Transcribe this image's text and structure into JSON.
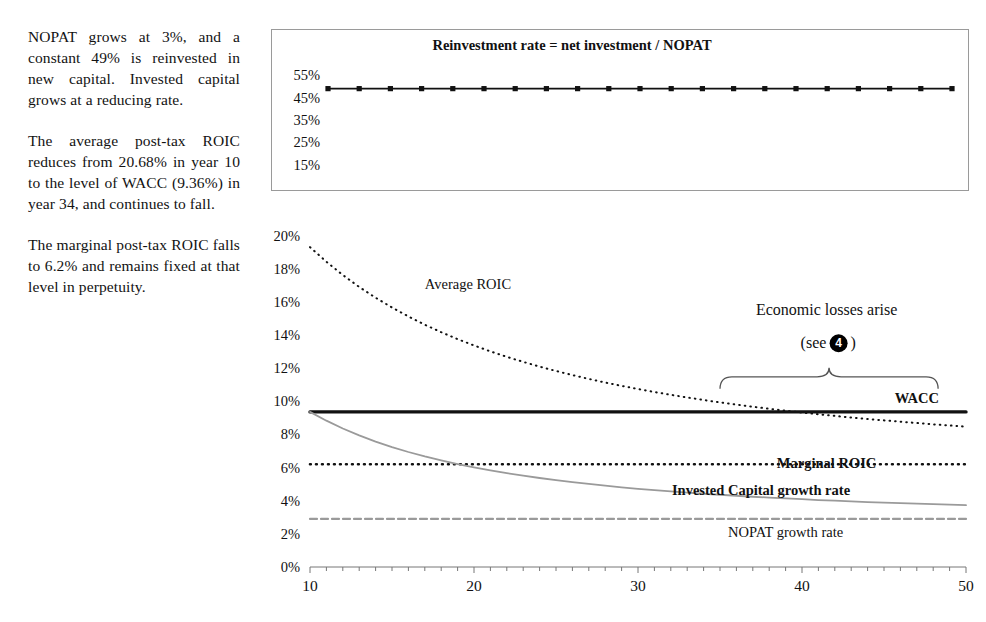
{
  "commentary": {
    "paragraphs": [
      "NOPAT grows at 3%, and a constant 49% is reinvested in new capital. Invested capital grows at a reducing rate.",
      "The average post-tax ROIC reduces from 20.68% in year 10 to the level of WACC (9.36%) in year 34, and continues to fall.",
      "The marginal post-tax ROIC falls to 6.2% and remains fixed at that level in perpetuity."
    ]
  },
  "colors": {
    "ink": "#111111",
    "grey_series": "#9a9a9a",
    "box_border": "#9a9a9a",
    "axis": "#777777"
  },
  "chart_data": [
    {
      "id": "reinvestment-chart",
      "type": "line",
      "title": "Reinvestment rate = net investment / NOPAT",
      "xlabel": "",
      "ylabel": "",
      "xlim": [
        10,
        50
      ],
      "ylim": [
        0.1,
        0.6
      ],
      "ytick_values": [
        0.55,
        0.45,
        0.35,
        0.25,
        0.15
      ],
      "ytick_labels": [
        "55%",
        "45%",
        "35%",
        "25%",
        "15%"
      ],
      "xtick_values": [],
      "xtick_labels": [],
      "grid": false,
      "legend": "none",
      "series": [
        {
          "name": "Reinvestment rate",
          "style": "solid-marker",
          "marker": "square",
          "color": "#111111",
          "x": [
            10,
            11,
            12,
            13,
            14,
            15,
            16,
            17,
            18,
            19,
            20,
            21,
            22,
            23,
            24,
            25,
            26,
            27,
            28,
            29,
            30,
            31,
            32,
            33,
            34,
            35,
            36,
            37,
            38,
            39,
            40,
            41,
            42,
            43,
            44,
            45,
            46,
            47,
            48,
            49,
            50
          ],
          "values": [
            0.49,
            0.49,
            0.49,
            0.49,
            0.49,
            0.49,
            0.49,
            0.49,
            0.49,
            0.49,
            0.49,
            0.49,
            0.49,
            0.49,
            0.49,
            0.49,
            0.49,
            0.49,
            0.49,
            0.49,
            0.49,
            0.49,
            0.49,
            0.49,
            0.49,
            0.49,
            0.49,
            0.49,
            0.49,
            0.49,
            0.49,
            0.49,
            0.49,
            0.49,
            0.49,
            0.49,
            0.49,
            0.49,
            0.49,
            0.49,
            0.49
          ]
        }
      ]
    },
    {
      "id": "roic-chart",
      "type": "line",
      "title": "",
      "xlabel": "",
      "ylabel": "",
      "xlim": [
        10,
        50
      ],
      "ylim": [
        0.0,
        0.21
      ],
      "ytick_values": [
        0.2,
        0.18,
        0.16,
        0.14,
        0.12,
        0.1,
        0.08,
        0.06,
        0.04,
        0.02,
        0.0
      ],
      "ytick_labels": [
        "20%",
        "18%",
        "16%",
        "14%",
        "12%",
        "10%",
        "8%",
        "6%",
        "4%",
        "2%",
        "0%"
      ],
      "xtick_values": [
        10,
        20,
        30,
        40,
        50
      ],
      "xtick_labels": [
        "10",
        "20",
        "30",
        "40",
        "50"
      ],
      "minor_xtick_step": 1,
      "grid": false,
      "legend": "inline-right",
      "series": [
        {
          "name": "Average ROIC",
          "label": "Average ROIC",
          "style": "dotted",
          "color": "#111111",
          "label_x": 17.0,
          "label_y": 0.168,
          "x": [
            10,
            11,
            12,
            13,
            14,
            15,
            16,
            17,
            18,
            19,
            20,
            21,
            22,
            23,
            24,
            25,
            26,
            27,
            28,
            29,
            30,
            31,
            32,
            33,
            34,
            35,
            36,
            37,
            38,
            39,
            40,
            41,
            42,
            43,
            44,
            45,
            46,
            47,
            48,
            49,
            50
          ],
          "values": [
            0.193,
            0.1842,
            0.1762,
            0.169,
            0.1625,
            0.1566,
            0.1512,
            0.1462,
            0.1417,
            0.1375,
            0.1337,
            0.1301,
            0.1268,
            0.1238,
            0.1209,
            0.1183,
            0.1158,
            0.1135,
            0.1113,
            0.1093,
            0.1074,
            0.1056,
            0.1039,
            0.1023,
            0.1008,
            0.0993,
            0.098,
            0.0967,
            0.0955,
            0.0943,
            0.0932,
            0.0922,
            0.0912,
            0.0902,
            0.0893,
            0.0885,
            0.0877,
            0.0869,
            0.0861,
            0.0854,
            0.0847
          ]
        },
        {
          "name": "WACC",
          "label": "WACC",
          "style": "solid-thick",
          "color": "#111111",
          "label_x": 47.0,
          "label_y": 0.099,
          "x": [
            10,
            50
          ],
          "values": [
            0.0936,
            0.0936
          ]
        },
        {
          "name": "Marginal ROIC",
          "label": "Marginal ROIC",
          "style": "dotted-thick",
          "color": "#111111",
          "label_x": 41.5,
          "label_y": 0.0595,
          "x": [
            10,
            50
          ],
          "values": [
            0.062,
            0.062
          ]
        },
        {
          "name": "Invested Capital growth rate",
          "label": "Invested Capital  growth rate",
          "style": "solid-grey",
          "color": "#9a9a9a",
          "label_x": 37.5,
          "label_y": 0.0435,
          "x": [
            10,
            11,
            12,
            13,
            14,
            15,
            16,
            17,
            18,
            19,
            20,
            21,
            22,
            23,
            24,
            25,
            26,
            27,
            28,
            29,
            30,
            31,
            32,
            33,
            34,
            35,
            36,
            37,
            38,
            39,
            40,
            41,
            42,
            43,
            44,
            45,
            46,
            47,
            48,
            49,
            50
          ],
          "values": [
            0.0936,
            0.0883,
            0.0836,
            0.0794,
            0.0757,
            0.0724,
            0.0694,
            0.0667,
            0.0643,
            0.0621,
            0.0601,
            0.0583,
            0.0566,
            0.0551,
            0.0537,
            0.0524,
            0.0512,
            0.0501,
            0.0491,
            0.0481,
            0.0472,
            0.0464,
            0.0456,
            0.0449,
            0.0442,
            0.0436,
            0.043,
            0.0424,
            0.0419,
            0.0414,
            0.0409,
            0.0404,
            0.04,
            0.0396,
            0.0392,
            0.0389,
            0.0385,
            0.0382,
            0.0379,
            0.0376,
            0.0373
          ]
        },
        {
          "name": "NOPAT growth rate",
          "label": "NOPAT growth rate",
          "style": "dashed-grey",
          "color": "#9a9a9a",
          "label_x": 39.0,
          "label_y": 0.018,
          "x": [
            10,
            50
          ],
          "values": [
            0.029,
            0.029
          ]
        }
      ],
      "annotations": [
        {
          "name": "economic-losses",
          "line1": "Economic losses arise",
          "line2_prefix": "(see ",
          "line2_badge": "4",
          "line2_suffix": ")",
          "brace_x_start": 35.0,
          "brace_x_end": 48.3,
          "text_x": 41.5,
          "line1_y": 0.152,
          "line2_y": 0.132
        }
      ]
    }
  ]
}
